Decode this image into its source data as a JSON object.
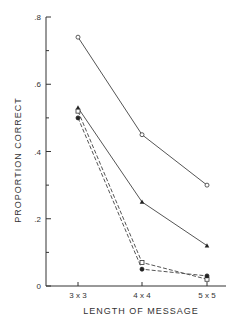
{
  "chart_data": {
    "type": "line",
    "title": "",
    "xlabel": "LENGTH OF MESSAGE",
    "ylabel": "PROPORTION CORRECT",
    "categories": [
      "3 x 3",
      "4 x 4",
      "5 x 5"
    ],
    "ylim": [
      0,
      0.8
    ],
    "yticks": [
      0,
      0.2,
      0.4,
      0.6,
      0.8
    ],
    "ytick_labels": [
      "0",
      ".2",
      ".4",
      ".6",
      ".8"
    ],
    "yminor_ticks": [
      0.1,
      0.3,
      0.5,
      0.7
    ],
    "grid": false,
    "legend": "none",
    "series": [
      {
        "name": "open-circle",
        "marker": "open-circle",
        "line": "solid",
        "values": [
          0.74,
          0.45,
          0.3
        ]
      },
      {
        "name": "filled-triangle",
        "marker": "filled-triangle",
        "line": "solid",
        "values": [
          0.53,
          0.25,
          0.12
        ]
      },
      {
        "name": "open-square",
        "marker": "open-square",
        "line": "dashed",
        "values": [
          0.52,
          0.07,
          0.02
        ]
      },
      {
        "name": "filled-circle",
        "marker": "filled-circle",
        "line": "dashed",
        "values": [
          0.5,
          0.05,
          0.03
        ]
      }
    ]
  }
}
